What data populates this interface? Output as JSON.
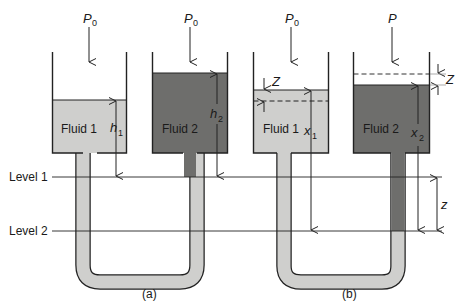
{
  "colors": {
    "fluid1": "#cfcfcd",
    "fluid2": "#6e6e6c",
    "line": "#222222",
    "background": "#ffffff"
  },
  "levels": {
    "level1": "Level 1",
    "level2": "Level 2"
  },
  "panel_a": {
    "caption": "(a)",
    "left_pressure": "P",
    "left_pressure_sub": "0",
    "right_pressure": "P",
    "right_pressure_sub": "0",
    "left_fluid": "Fluid 1",
    "right_fluid": "Fluid 2",
    "left_height": "h",
    "left_height_sub": "1",
    "right_height": "h",
    "right_height_sub": "2"
  },
  "panel_b": {
    "caption": "(b)",
    "left_pressure": "P",
    "left_pressure_sub": "0",
    "right_pressure": "P",
    "left_fluid": "Fluid 1",
    "right_fluid": "Fluid 2",
    "left_height": "x",
    "left_height_sub": "1",
    "right_height": "x",
    "right_height_sub": "2",
    "left_displacement": "Z",
    "right_displacement": "Z",
    "level_difference": "z"
  }
}
